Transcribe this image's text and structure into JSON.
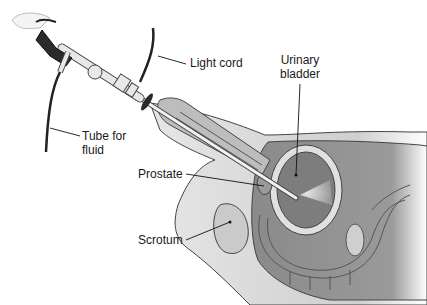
{
  "diagram": {
    "type": "medical-illustration",
    "labels": {
      "light_cord": "Light cord",
      "urinary_bladder_line1": "Urinary",
      "urinary_bladder_line2": "bladder",
      "tube_line1": "Tube for",
      "tube_line2": "fluid",
      "prostate": "Prostate",
      "scrotum": "Scrotum"
    },
    "colors": {
      "background": "#ffffff",
      "body_fill": "#d6d6d6",
      "inner_organ": "#8f8f8f",
      "bladder_fill": "#7d7d7d",
      "outline": "#333333",
      "instrument": "#e8e8e8",
      "eyepiece": "#2b2b2b"
    }
  }
}
